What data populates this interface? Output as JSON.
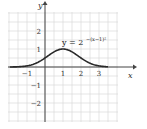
{
  "chart_data": {
    "type": "line",
    "title": "",
    "xlabel": "x",
    "ylabel": "y",
    "xlim": [
      -2,
      3.5
    ],
    "ylim": [
      -3,
      3
    ],
    "grid": true,
    "x_ticks": [
      -1,
      1,
      2,
      3
    ],
    "x_tick_labels": [
      "−1",
      "1",
      "2",
      "3"
    ],
    "y_ticks": [
      2,
      1,
      -1,
      -2
    ],
    "y_tick_labels": [
      "2",
      "1",
      "−1",
      "−2"
    ],
    "annotation": {
      "base": "y = 2",
      "exponent": "−(x−1)²",
      "position": "above curve peak, right"
    },
    "series": [
      {
        "name": "y = 2^{-(x-1)^2}",
        "function": "2^(-(x-1)^2)",
        "x": [
          -2,
          -1.5,
          -1,
          -0.5,
          0,
          0.5,
          1,
          1.5,
          2,
          2.5,
          3,
          3.5
        ],
        "y": [
          0.002,
          0.013,
          0.063,
          0.21,
          0.5,
          0.841,
          1,
          0.841,
          0.5,
          0.21,
          0.063,
          0.013
        ]
      }
    ]
  }
}
